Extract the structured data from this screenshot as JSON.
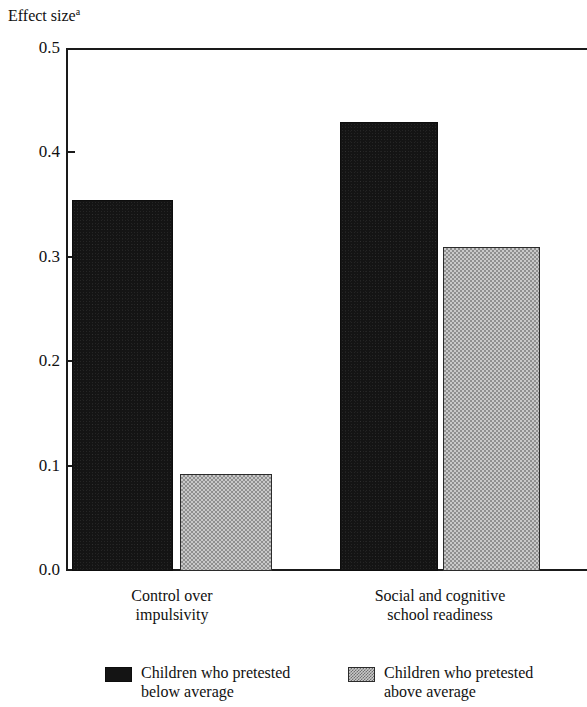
{
  "figure": {
    "y_axis_title_text": "Effect size",
    "y_axis_title_superscript": "a"
  },
  "legend": {
    "items": [
      {
        "label": "Children who pretested\nbelow average",
        "swatch": "dark-solid",
        "color": "#141414"
      },
      {
        "label": "Children who pretested\nabove average",
        "swatch": "light-checkered",
        "color": "#c9c9c9"
      }
    ]
  },
  "chart_data": {
    "type": "bar",
    "title": "",
    "subtitle": "",
    "xlabel": "",
    "ylabel": "Effect size",
    "ylabel_superscript": "a",
    "ylim": [
      0.0,
      0.5
    ],
    "yticks": [
      "0.0",
      "0.1",
      "0.2",
      "0.3",
      "0.4",
      "0.5"
    ],
    "ytick_values": [
      0.0,
      0.1,
      0.2,
      0.3,
      0.4,
      0.5
    ],
    "grid": false,
    "legend_position": "bottom",
    "categories": [
      "Control over\nimpulsivity",
      "Social and cognitive\nschool readiness"
    ],
    "series": [
      {
        "name": "Children who pretested below average",
        "values": [
          0.355,
          0.43
        ],
        "color": "#141414",
        "pattern": "solid-dark"
      },
      {
        "name": "Children who pretested above average",
        "values": [
          0.093,
          0.31
        ],
        "color": "#c9c9c9",
        "pattern": "checkered-light"
      }
    ]
  }
}
